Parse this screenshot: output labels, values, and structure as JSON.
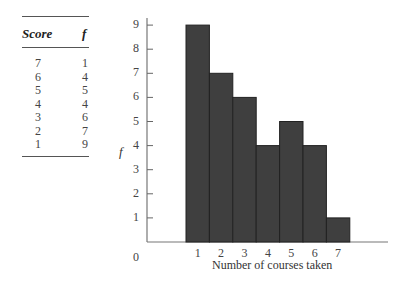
{
  "table": {
    "headers": [
      "Score",
      "f"
    ],
    "rows": [
      {
        "score": "7",
        "f": "1"
      },
      {
        "score": "6",
        "f": "4"
      },
      {
        "score": "5",
        "f": "5"
      },
      {
        "score": "4",
        "f": "4"
      },
      {
        "score": "3",
        "f": "6"
      },
      {
        "score": "2",
        "f": "7"
      },
      {
        "score": "1",
        "f": "9"
      }
    ]
  },
  "chart_data": {
    "type": "bar",
    "title": "",
    "categories": [
      "1",
      "2",
      "3",
      "4",
      "5",
      "6",
      "7"
    ],
    "values": [
      9,
      7,
      6,
      4,
      5,
      4,
      1
    ],
    "xlabel": "Number of courses taken",
    "ylabel": "f",
    "ylim": [
      0,
      9
    ],
    "yticks": [
      "1",
      "2",
      "3",
      "4",
      "5",
      "6",
      "7",
      "8",
      "9"
    ],
    "origin_label": "0",
    "grid": false,
    "legend": null,
    "bar_color": "#3f3f3f"
  }
}
